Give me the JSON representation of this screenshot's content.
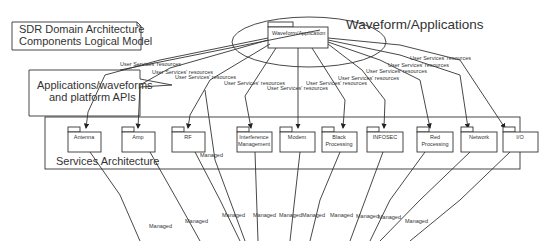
{
  "note": {
    "line1": "SDR Domain Architecture",
    "line2": "Components Logical Model"
  },
  "callout": {
    "line1": "Applications/waveforms",
    "line2": "and platform APIs"
  },
  "waveform": {
    "title": "Waveform/Applications",
    "package_label": "Waveform/Application"
  },
  "services": {
    "title": "Services Architecture",
    "packages": [
      {
        "id": "antenna",
        "lines": [
          "Antenna"
        ]
      },
      {
        "id": "amp",
        "lines": [
          "Amp"
        ]
      },
      {
        "id": "rf",
        "lines": [
          "RF"
        ]
      },
      {
        "id": "interference-management",
        "lines": [
          "Interference",
          "Management"
        ]
      },
      {
        "id": "modem",
        "lines": [
          "Modem"
        ]
      },
      {
        "id": "black-processing",
        "lines": [
          "Black",
          "Processing"
        ]
      },
      {
        "id": "infosec",
        "lines": [
          "INFOSEC"
        ]
      },
      {
        "id": "red-processing",
        "lines": [
          "Red",
          "Processing"
        ]
      },
      {
        "id": "network",
        "lines": [
          "Network"
        ]
      },
      {
        "id": "io",
        "lines": [
          "I/O"
        ]
      }
    ]
  },
  "connector_labels": {
    "user_services": "User Services' resources",
    "managed": "Managed"
  }
}
